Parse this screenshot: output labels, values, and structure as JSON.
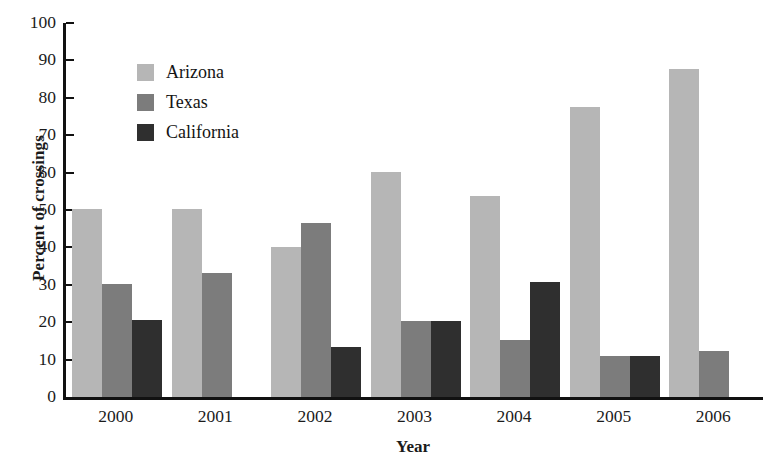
{
  "figure": {
    "scan_artifact_text": "smudge"
  },
  "legend": {
    "position": "upper-left-inside",
    "items": [
      {
        "label": "Arizona",
        "color": "#b6b6b6"
      },
      {
        "label": "Texas",
        "color": "#7c7c7c"
      },
      {
        "label": "California",
        "color": "#2f2f2f"
      }
    ]
  },
  "axes": {
    "ylabel": "Percent of crossings",
    "xlabel": "Year",
    "yticks": [
      "100",
      "90",
      "80",
      "70",
      "60",
      "50",
      "40",
      "30",
      "20",
      "10",
      "0"
    ],
    "xticks": [
      "2000",
      "2001",
      "2002",
      "2003",
      "2004",
      "2005",
      "2006"
    ]
  },
  "chart_data": {
    "type": "bar",
    "title": "",
    "xlabel": "Year",
    "ylabel": "Percent of crossings",
    "categories": [
      "2000",
      "2001",
      "2002",
      "2003",
      "2004",
      "2005",
      "2006"
    ],
    "series": [
      {
        "name": "Arizona",
        "color": "#b6b6b6",
        "values": [
          50.3,
          50.3,
          40.0,
          60.2,
          53.8,
          77.5,
          87.7
        ]
      },
      {
        "name": "Texas",
        "color": "#7c7c7c",
        "values": [
          30.3,
          33.2,
          46.4,
          20.2,
          15.3,
          11.1,
          12.4
        ]
      },
      {
        "name": "California",
        "color": "#2f2f2f",
        "values": [
          20.5,
          0,
          13.4,
          20.3,
          30.8,
          11.1,
          0
        ]
      }
    ],
    "ylim": [
      0,
      100
    ],
    "ytick_step": 10,
    "grid": false,
    "legend_position": "upper left (inside plot)"
  }
}
